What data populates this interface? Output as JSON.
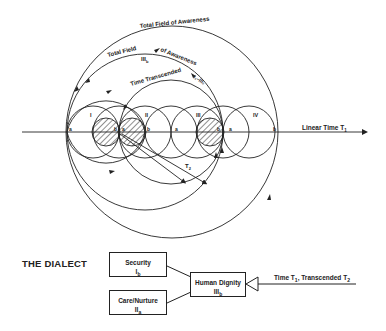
{
  "diagram": {
    "outer_arc_label": "Total Field of Awareness",
    "inner_arc_label": "Total Field",
    "inner_arc_label_end": "of Awareness",
    "inner_arc_sub": "III",
    "inner_arc_sub_index": "b",
    "time_arc_label": "Time Transcended",
    "time_arc_tag": "I₁–III₂",
    "axis_label": "Linear Time T",
    "axis_label_sub": "1",
    "t2_label": "T",
    "t2_label_sub": "2",
    "circle_labels": [
      "I",
      "II",
      "III",
      "IV"
    ],
    "point_labels": [
      "a",
      "b",
      "a",
      "b",
      "a",
      "b",
      "a",
      "b"
    ],
    "colors": {
      "ink": "#222222",
      "background": "#ffffff"
    }
  },
  "dialect": {
    "title": "THE DIALECT",
    "boxes": [
      {
        "label": "Security",
        "sub": "I",
        "sub_index": "b"
      },
      {
        "label": "Care/Nurture",
        "sub": "II",
        "sub_index": "a"
      },
      {
        "label": "Human Dignity",
        "sub": "III",
        "sub_index": "b"
      }
    ],
    "input_label_prefix": "Time T",
    "input_label_sub1": "1",
    "input_label_mid": ", Transcended T",
    "input_label_sub2": "2"
  }
}
